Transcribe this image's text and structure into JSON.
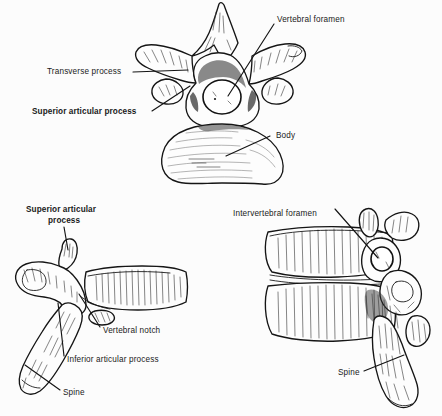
{
  "figure": {
    "background_color": "#fcfcfc",
    "ink_color": "#151515",
    "panels": [
      {
        "id": "superior-view",
        "name": "superior-view-vertebra",
        "description": "Superior (top-down) view of a thoracic vertebra",
        "labels": [
          {
            "text": "Vertebral foramen",
            "weight": "regular"
          },
          {
            "text": "Transverse process",
            "weight": "regular"
          },
          {
            "text": "Superior articular process",
            "weight": "bold"
          },
          {
            "text": "Body",
            "weight": "regular"
          }
        ]
      },
      {
        "id": "lateral-view",
        "name": "lateral-view-vertebra",
        "description": "Lateral (side) view of a single vertebra",
        "labels": [
          {
            "text": "Superior articular",
            "weight": "bold"
          },
          {
            "text": "process",
            "weight": "bold"
          },
          {
            "text": "Vertebral notch",
            "weight": "regular"
          },
          {
            "text": "Inferior articular process",
            "weight": "regular"
          },
          {
            "text": "Spine",
            "weight": "regular"
          }
        ]
      },
      {
        "id": "stacked-view",
        "name": "stacked-vertebrae-view",
        "description": "Lateral view of two articulated vertebrae",
        "labels": [
          {
            "text": "Intervertebral foramen",
            "weight": "regular"
          },
          {
            "text": "Spine",
            "weight": "regular"
          }
        ]
      }
    ]
  },
  "labels": {
    "vertebral_foramen": "Vertebral foramen",
    "transverse_process": "Transverse process",
    "superior_articular_process": "Superior articular process",
    "body": "Body",
    "superior_articular_line1": "Superior articular",
    "superior_articular_line2": "process",
    "vertebral_notch": "Vertebral notch",
    "inferior_articular_process": "Inferior articular process",
    "spine_left": "Spine",
    "intervertebral_foramen": "Intervertebral foramen",
    "spine_right": "Spine"
  }
}
